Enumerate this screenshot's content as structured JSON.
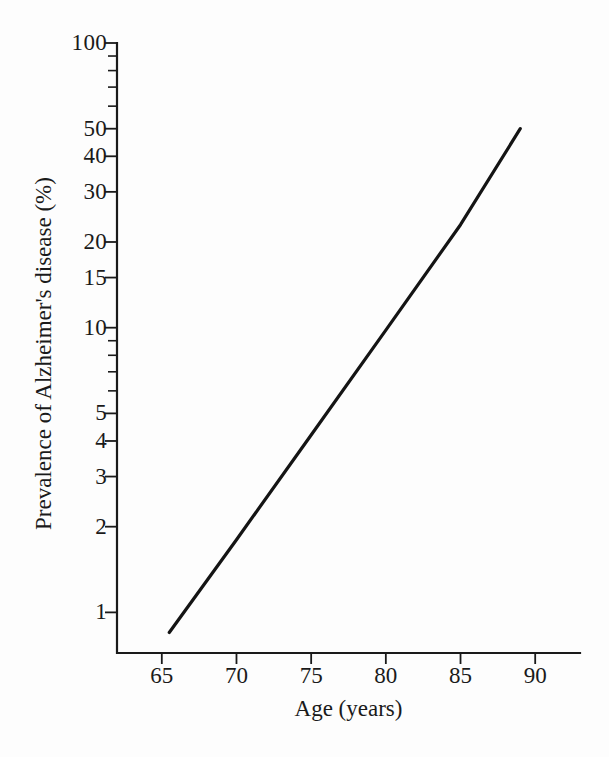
{
  "chart_data": {
    "type": "line",
    "title": "",
    "xlabel": "Age (years)",
    "ylabel": "Prevalence of Alzheimer's disease (%)",
    "xscale": "linear",
    "yscale": "log",
    "xlim": [
      62,
      93
    ],
    "ylim": [
      0.72,
      100
    ],
    "grid": false,
    "legend": null,
    "xticks": [
      65,
      70,
      75,
      80,
      85,
      90
    ],
    "xtick_labels": [
      "65",
      "70",
      "75",
      "80",
      "85",
      "90"
    ],
    "yticks": [
      1,
      2,
      3,
      4,
      5,
      10,
      15,
      20,
      30,
      40,
      50,
      100
    ],
    "ytick_labels": [
      "1",
      "2",
      "3",
      "4",
      "5",
      "10",
      "15",
      "20",
      "30",
      "40",
      "50",
      "100"
    ],
    "yticks_minor": [
      6,
      7,
      8,
      9,
      60,
      70,
      80,
      90
    ],
    "series": [
      {
        "name": "Prevalence of Alzheimer's disease",
        "color": "#141414",
        "x": [
          65.5,
          70,
          75,
          80,
          85,
          89
        ],
        "values": [
          0.85,
          1.8,
          4.2,
          9.8,
          23.0,
          50.0
        ]
      }
    ],
    "annotations": []
  },
  "axis": {
    "x_title": "Age (years)",
    "y_title": "Prevalence of Alzheimer's disease (%)"
  }
}
